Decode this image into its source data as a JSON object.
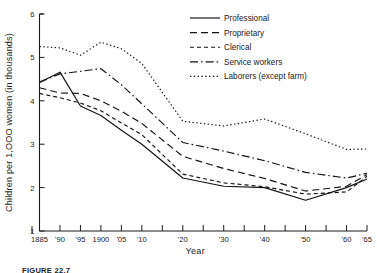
{
  "figure": {
    "caption": "FIGURE 22.7"
  },
  "chart_data": {
    "type": "line",
    "title": "",
    "xlabel": "Year",
    "ylabel": "Children per 1,OOO women (in thousands)",
    "xlim": [
      1885,
      1965
    ],
    "ylim": [
      1,
      6
    ],
    "grid": false,
    "legend_position": "top-right",
    "x_tick_values": [
      1885,
      1890,
      1895,
      1900,
      1905,
      1910,
      1915,
      1920,
      1925,
      1930,
      1935,
      1940,
      1945,
      1950,
      1955,
      1960,
      1965
    ],
    "x_tick_labels": [
      "1885",
      "'90",
      "'95",
      "1900",
      "'05",
      "'10",
      "",
      "'20",
      "",
      "'30",
      "",
      "'40",
      "",
      "'50",
      "",
      "'60",
      "'65"
    ],
    "y_tick_values": [
      1,
      2,
      3,
      4,
      5,
      6
    ],
    "y_tick_labels": [
      "1",
      "2",
      "3",
      "4",
      "5",
      "6"
    ],
    "x": [
      1885,
      1890,
      1895,
      1900,
      1905,
      1910,
      1920,
      1930,
      1940,
      1950,
      1960,
      1965
    ],
    "series": [
      {
        "name": "Professional",
        "style": "solid",
        "dasharray": "",
        "values": [
          4.42,
          4.66,
          3.88,
          3.66,
          3.32,
          3.0,
          2.22,
          2.03,
          2.0,
          1.71,
          2.0,
          2.2
        ]
      },
      {
        "name": "Proprietary",
        "style": "long-dash",
        "dasharray": "7,4",
        "values": [
          4.3,
          4.18,
          4.17,
          4.0,
          3.76,
          3.48,
          2.72,
          2.44,
          2.21,
          1.92,
          2.03,
          2.3
        ]
      },
      {
        "name": "Clerical",
        "style": "short-dash",
        "dasharray": "4,3",
        "values": [
          4.17,
          4.07,
          3.95,
          3.77,
          3.49,
          3.22,
          2.31,
          2.11,
          2.02,
          1.85,
          1.9,
          2.26
        ]
      },
      {
        "name": "Service workers",
        "style": "dash-dot",
        "dasharray": "8,3,1.6,3",
        "values": [
          4.43,
          4.62,
          4.68,
          4.74,
          4.37,
          3.93,
          3.04,
          2.84,
          2.62,
          2.35,
          2.22,
          2.33
        ]
      },
      {
        "name": "Laborers (except farm)",
        "style": "dotted",
        "dasharray": "1.4,2.4",
        "values": [
          5.25,
          5.22,
          5.05,
          5.35,
          5.2,
          4.86,
          3.53,
          3.42,
          3.58,
          3.24,
          2.88,
          2.89
        ]
      }
    ]
  },
  "legend": {
    "items": [
      {
        "label": "Professional"
      },
      {
        "label": "Proprietary"
      },
      {
        "label": "Clerical"
      },
      {
        "label": "Service workers"
      },
      {
        "label": "Laborers (except farm)"
      }
    ]
  }
}
